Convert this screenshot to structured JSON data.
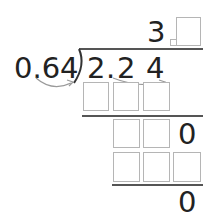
{
  "problem": {
    "divisor": "0.64",
    "dividend": {
      "d1": "2",
      "dot": ".",
      "d2": "2",
      "d3": "4"
    },
    "quotient": {
      "digit": "3",
      "blank_decimal_box": "",
      "blank_digit_box": ""
    },
    "step1": {
      "boxes": [
        "",
        "",
        ""
      ]
    },
    "step2": {
      "boxes": [
        "",
        ""
      ],
      "trailing_digit": "0"
    },
    "step3": {
      "boxes": [
        "",
        "",
        ""
      ]
    },
    "remainder": "0"
  },
  "colors": {
    "text": "#222222",
    "box_border": "#b5b5b5",
    "rule": "#555555",
    "arrow": "#9a9a9a"
  }
}
